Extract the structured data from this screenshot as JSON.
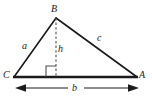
{
  "diagram": {
    "type": "triangle-with-altitude",
    "background_color": "#ffffff",
    "stroke_color": "#1a1a1a",
    "dashed_color": "#555555",
    "labels": {
      "vertex_top": "B",
      "vertex_left": "C",
      "vertex_right": "A",
      "side_left": "a",
      "side_right": "c",
      "side_base": "b",
      "altitude": "h"
    },
    "geometry": {
      "vertex_B": [
        56,
        18
      ],
      "vertex_C": [
        14,
        77
      ],
      "vertex_A": [
        137,
        77
      ],
      "foot_of_altitude": [
        56,
        77
      ],
      "right_angle_marker_size": 10,
      "dimension_line_y": 88,
      "dimension_line_x_start": 16,
      "dimension_line_x_end": 138
    }
  }
}
